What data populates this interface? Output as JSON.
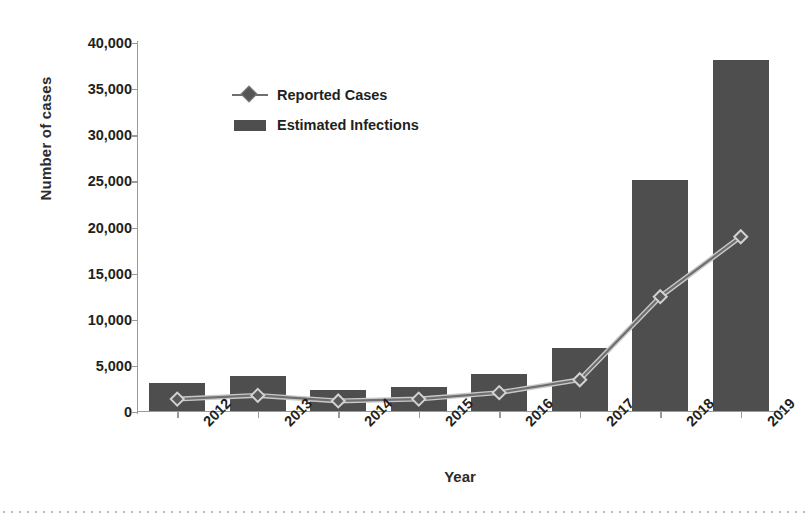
{
  "chart_data": {
    "type": "bar",
    "title": "",
    "subtitle": "",
    "xlabel": "Year",
    "ylabel": "Number of cases",
    "categories": [
      "2012",
      "2013",
      "2014",
      "2015",
      "2016",
      "2017",
      "2018",
      "2019"
    ],
    "ylim": [
      0,
      40000
    ],
    "ytick_values": [
      0,
      5000,
      10000,
      15000,
      20000,
      25000,
      30000,
      35000,
      40000
    ],
    "ytick_labels": [
      "0",
      "5,000",
      "10,000",
      "15,000",
      "20,000",
      "25,000",
      "30,000",
      "35,000",
      "40,000"
    ],
    "grid": false,
    "legend_position": "upper-left-inside",
    "series": [
      {
        "name": "Reported Cases",
        "type": "line",
        "marker": "diamond",
        "color": "#6f6f6f",
        "values": [
          1400,
          1800,
          1200,
          1400,
          2100,
          3500,
          12500,
          19000
        ]
      },
      {
        "name": "Estimated Infections",
        "type": "bar",
        "color": "#4e4e4e",
        "values": [
          3000,
          3700,
          2200,
          2600,
          4000,
          6800,
          25000,
          38000
        ]
      }
    ],
    "annotations": []
  },
  "legend": {
    "items": [
      {
        "label": "Reported Cases",
        "key": "line-diamond-marker"
      },
      {
        "label": "Estimated Infections",
        "key": "bar-swatch"
      }
    ]
  },
  "colors": {
    "bar": "#4e4e4e",
    "line": "#6f6f6f",
    "marker_fill": "#555555",
    "axis": "#9a9a9a",
    "text": "#231f20",
    "background": "#ffffff"
  }
}
